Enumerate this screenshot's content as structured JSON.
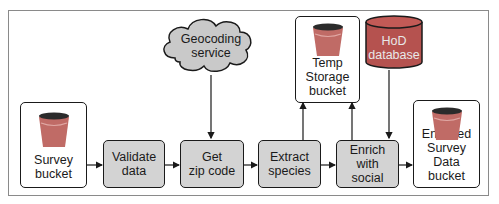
{
  "diagram": {
    "nodes": {
      "survey_bucket": {
        "label": "Survey\nbucket",
        "type": "bucket"
      },
      "validate_data": {
        "label": "Validate\ndata",
        "type": "process"
      },
      "get_zip_code": {
        "label": "Get\nzip code",
        "type": "process"
      },
      "extract_species": {
        "label": "Extract\nspecies",
        "type": "process"
      },
      "enrich_with_social": {
        "label": "Enrich with\nsocial",
        "type": "process"
      },
      "enriched_bucket": {
        "label": "Enriched\nSurvey Data\nbucket",
        "type": "bucket"
      },
      "temp_storage_bucket": {
        "label": "Temp\nStorage\nbucket",
        "type": "bucket"
      },
      "geocoding_service": {
        "label": "Geocoding\nservice",
        "type": "cloud"
      },
      "hod_database": {
        "label": "HoD\ndatabase",
        "type": "database"
      }
    },
    "edges": [
      {
        "from": "survey_bucket",
        "to": "validate_data"
      },
      {
        "from": "validate_data",
        "to": "get_zip_code"
      },
      {
        "from": "geocoding_service",
        "to": "get_zip_code"
      },
      {
        "from": "get_zip_code",
        "to": "extract_species"
      },
      {
        "from": "extract_species",
        "to": "temp_storage_bucket"
      },
      {
        "from": "extract_species",
        "to": "enrich_with_social"
      },
      {
        "from": "enrich_with_social",
        "to": "temp_storage_bucket"
      },
      {
        "from": "hod_database",
        "to": "enrich_with_social"
      },
      {
        "from": "enrich_with_social",
        "to": "enriched_bucket"
      }
    ],
    "colors": {
      "process_fill": "#d3d3d3",
      "bucket_fill": "#c06b66",
      "bucket_rim": "#2b2b2b",
      "database_fill": "#b5524f",
      "cloud_fill": "#c9c9c9",
      "stroke": "#1a1a1a"
    }
  }
}
